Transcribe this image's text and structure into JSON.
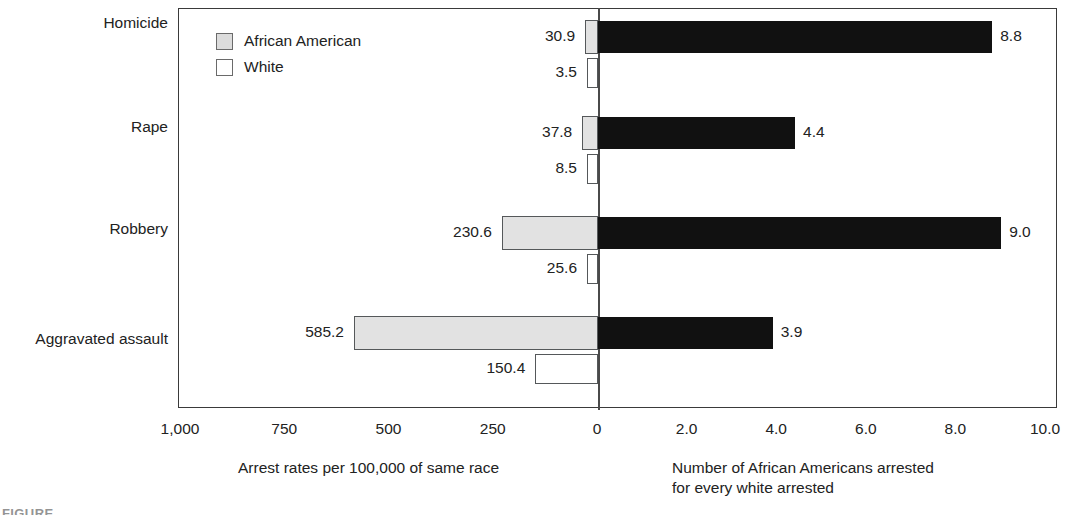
{
  "chart_data": {
    "type": "bar",
    "title": "",
    "subtitle": "",
    "orientation": "horizontal",
    "layout": "back-to-back bidirectional bar chart with two independent x-axes sharing a zero line",
    "categories": [
      "Homicide",
      "Rape",
      "Robbery",
      "Aggravated assault"
    ],
    "series": [
      {
        "name": "African American",
        "axis": "left",
        "color": "#e2e2e2",
        "values": [
          30.9,
          37.8,
          230.6,
          585.2
        ]
      },
      {
        "name": "White",
        "axis": "left",
        "color": "#ffffff",
        "values": [
          3.5,
          8.5,
          25.6,
          150.4
        ]
      },
      {
        "name": "Number of African Americans arrested for every white arrested",
        "axis": "right",
        "color": "#111111",
        "values": [
          8.8,
          4.4,
          9.0,
          3.9
        ]
      }
    ],
    "left_axis": {
      "label": "Arrest rates per 100,000 of same race",
      "ticks": [
        "1,000",
        "750",
        "500",
        "250",
        "0"
      ],
      "tick_values": [
        1000,
        750,
        500,
        250,
        0
      ],
      "range": [
        1000,
        0
      ],
      "direction": "descending toward zero (rightward)"
    },
    "right_axis": {
      "label": "Number of African Americans arrested for every white arrested",
      "ticks": [
        "0",
        "2.0",
        "4.0",
        "6.0",
        "8.0",
        "10.0"
      ],
      "tick_values": [
        0,
        2.0,
        4.0,
        6.0,
        8.0,
        10.0
      ],
      "range": [
        0,
        10
      ],
      "direction": "ascending rightward"
    },
    "grid": false,
    "legend": {
      "position": "inside top-left of plot area",
      "entries": [
        "African American",
        "White"
      ]
    },
    "annotations": [
      "30.9",
      "3.5",
      "8.8",
      "37.8",
      "8.5",
      "4.4",
      "230.6",
      "25.6",
      "9.0",
      "585.2",
      "150.4",
      "3.9"
    ]
  },
  "legend": {
    "items": [
      {
        "label": "African American",
        "swatch": "gray-filled-square",
        "color": "#e2e2e2"
      },
      {
        "label": "White",
        "swatch": "white-empty-square",
        "color": "#ffffff"
      }
    ]
  },
  "rows": [
    {
      "category": "Homicide",
      "aa_value": "30.9",
      "white_value": "3.5",
      "ratio_value": "8.8",
      "aa_number": 30.9,
      "white_number": 3.5,
      "ratio_number": 8.8
    },
    {
      "category": "Rape",
      "aa_value": "37.8",
      "white_value": "8.5",
      "ratio_value": "4.4",
      "aa_number": 37.8,
      "white_number": 8.5,
      "ratio_number": 4.4
    },
    {
      "category": "Robbery",
      "aa_value": "230.6",
      "white_value": "25.6",
      "ratio_value": "9.0",
      "aa_number": 230.6,
      "white_number": 25.6,
      "ratio_number": 9.0
    },
    {
      "category": "Aggravated assault",
      "aa_value": "585.2",
      "white_value": "150.4",
      "ratio_value": "3.9",
      "aa_number": 585.2,
      "white_number": 150.4,
      "ratio_number": 3.9
    }
  ],
  "axes": {
    "left_ticks": [
      "1,000",
      "750",
      "500",
      "250",
      "0"
    ],
    "right_ticks": [
      "2.0",
      "4.0",
      "6.0",
      "8.0",
      "10.0"
    ],
    "left_title": "Arrest rates per 100,000 of same race",
    "right_title": "Number of African Americans arrested\nfor every white arrested"
  },
  "caption": {
    "partial_text": "FIGURE"
  },
  "colors": {
    "african_american_fill": "#e2e2e2",
    "white_fill": "#ffffff",
    "ratio_fill": "#111111",
    "frame": "#3a3a3a",
    "text": "#222222"
  }
}
